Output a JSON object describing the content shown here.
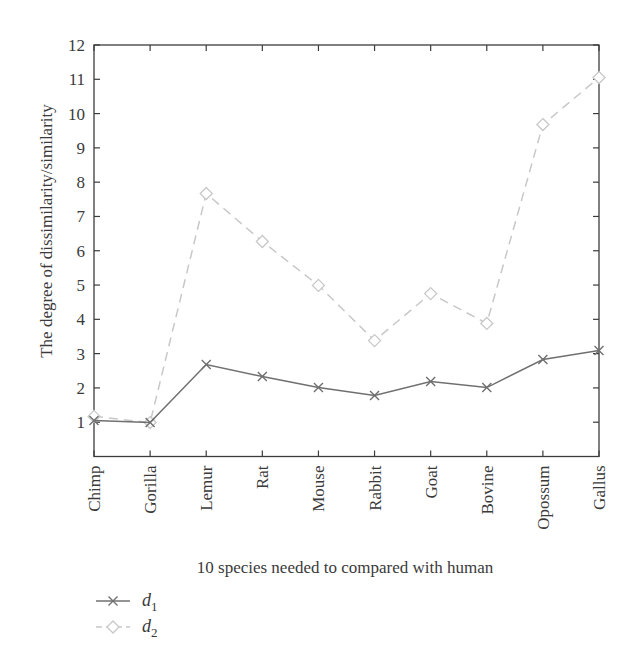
{
  "chart_data": {
    "type": "line",
    "title": "",
    "xlabel": "10 species needed to compared with human",
    "ylabel": "The degree of dissimilarity/similarity",
    "categories": [
      "Chimp",
      "Gorilla",
      "Lemur",
      "Rat",
      "Mouse",
      "Rabbit",
      "Goat",
      "Bovine",
      "Opossum",
      "Gallus"
    ],
    "ylim": [
      0,
      12
    ],
    "yticks": [
      1,
      2,
      3,
      4,
      5,
      6,
      7,
      8,
      9,
      10,
      11,
      12
    ],
    "grid": false,
    "legend_position": "below-left",
    "series": [
      {
        "name": "d1",
        "label_base": "d",
        "label_sub": "1",
        "marker": "x",
        "line_style": "solid",
        "color": "#707070",
        "values": [
          1.05,
          0.99,
          2.68,
          2.33,
          2.01,
          1.78,
          2.19,
          2.01,
          2.83,
          3.09
        ]
      },
      {
        "name": "d2",
        "label_base": "d",
        "label_sub": "2",
        "marker": "diamond",
        "line_style": "dashed",
        "color": "#c8c8c8",
        "values": [
          1.17,
          0.99,
          7.67,
          6.27,
          4.99,
          3.38,
          4.75,
          3.88,
          9.68,
          11.05
        ]
      }
    ]
  }
}
